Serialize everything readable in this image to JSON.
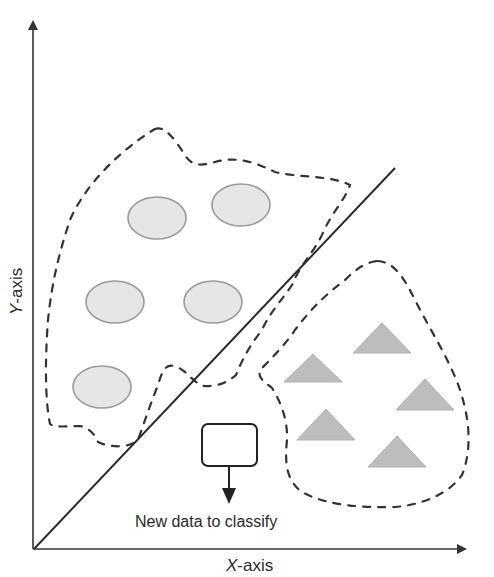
{
  "diagram": {
    "x_axis_label": {
      "italic": "X",
      "rest": "-axis"
    },
    "y_axis_label": {
      "italic": "Y",
      "rest": "-axis"
    },
    "new_data_label": "New data to classify",
    "colors": {
      "axis": "#333333",
      "boundary": "#2b2b2b",
      "cluster_outline": "#333333",
      "circle_fill": "#e6e6e6",
      "circle_stroke": "#9a9a9a",
      "triangle_fill": "#bdbdbd",
      "box_stroke": "#222222"
    },
    "class_a": {
      "shape": "circle",
      "items": [
        {
          "cx": 157,
          "cy": 218
        },
        {
          "cx": 241,
          "cy": 205
        },
        {
          "cx": 115,
          "cy": 302
        },
        {
          "cx": 213,
          "cy": 302
        },
        {
          "cx": 102,
          "cy": 387
        }
      ]
    },
    "class_b": {
      "shape": "triangle",
      "items": [
        {
          "cx": 313,
          "top": 354,
          "bottom": 382
        },
        {
          "cx": 382,
          "top": 323,
          "bottom": 353
        },
        {
          "cx": 425,
          "top": 379,
          "bottom": 410
        },
        {
          "cx": 326,
          "top": 409,
          "bottom": 440
        },
        {
          "cx": 397,
          "top": 436,
          "bottom": 467
        }
      ]
    },
    "new_point": {
      "x": 202,
      "y": 424,
      "w": 55,
      "h": 42
    }
  }
}
